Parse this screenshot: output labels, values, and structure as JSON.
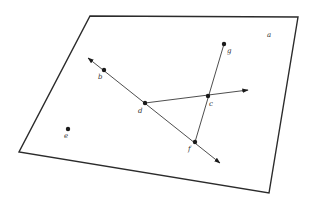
{
  "diagram": {
    "type": "geometry-plane",
    "plane": {
      "name": "a",
      "corners": [
        [
          90,
          16
        ],
        [
          298,
          17
        ],
        [
          269,
          193
        ],
        [
          19,
          152
        ]
      ],
      "label": "a",
      "label_pos": [
        267,
        37
      ]
    },
    "points": [
      {
        "name": "b",
        "label": "b",
        "pos": [
          104,
          70
        ],
        "label_pos": [
          98,
          79
        ]
      },
      {
        "name": "c",
        "label": "c",
        "pos": [
          208,
          96
        ],
        "label_pos": [
          209,
          106
        ]
      },
      {
        "name": "d",
        "label": "d",
        "pos": [
          145,
          103
        ],
        "label_pos": [
          138,
          113
        ]
      },
      {
        "name": "e",
        "label": "e",
        "pos": [
          68,
          129
        ],
        "label_pos": [
          64,
          138
        ]
      },
      {
        "name": "f",
        "label": "f",
        "pos": [
          195,
          142
        ],
        "label_pos": [
          188,
          151
        ]
      },
      {
        "name": "g",
        "label": "g",
        "pos": [
          224,
          44
        ],
        "label_pos": [
          227,
          53
        ]
      }
    ],
    "lines": [
      {
        "name": "line-bf",
        "type": "line",
        "from": [
          88,
          58
        ],
        "to": [
          220,
          163
        ],
        "arrows": "both"
      },
      {
        "name": "ray-dc",
        "type": "ray",
        "from": [
          145,
          103
        ],
        "to": [
          248,
          90
        ],
        "arrows": "end"
      },
      {
        "name": "segment-gf",
        "type": "segment",
        "from": [
          224,
          44
        ],
        "to": [
          195,
          142
        ],
        "arrows": "none"
      }
    ],
    "colors": {
      "stroke": "#2b2b2b",
      "point": "#1a1a1a",
      "background": "#ffffff"
    }
  }
}
